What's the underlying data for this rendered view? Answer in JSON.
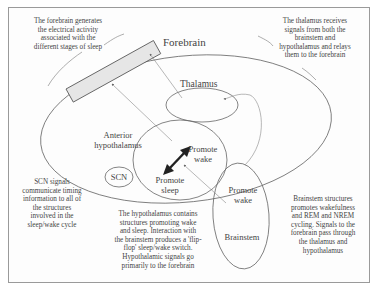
{
  "diagram": {
    "structures": {
      "forebrain": "Forebrain",
      "thalamus": "Thalamus",
      "anterior_hypothalamus": "Anterior hypothalamus",
      "anterior_hypothalamus_line1": "Anterior",
      "anterior_hypothalamus_line2": "hypothalamus",
      "hypothalamus_promote_wake_line1": "Promote",
      "hypothalamus_promote_wake_line2": "wake",
      "hypothalamus_promote_sleep_line1": "Promote",
      "hypothalamus_promote_sleep_line2": "sleep",
      "scn": "SCN",
      "brainstem_promote_wake_line1": "Promote",
      "brainstem_promote_wake_line2": "wake",
      "brainstem": "Brainstem"
    },
    "annotations": {
      "forebrain": [
        "The forebrain generates",
        "the electrical activity",
        "associated with the",
        "different stages of sleep"
      ],
      "thalamus": [
        "The thalamus receives",
        "signals from both the",
        "brainstem and",
        "hypothalamus and relays",
        "them to the forebrain"
      ],
      "scn": [
        "SCN signals",
        "communicate timing",
        "information to all of",
        "the structures",
        "involved in the",
        "sleep/wake cycle"
      ],
      "hypothalamus": [
        "The hypothalamus contains",
        "structures promoting wake",
        "and sleep. Interaction with",
        "the brainstem produces a 'flip-",
        "flop' sleep/wake switch.",
        "Hypothalamic signals go",
        "primarily to the forebrain"
      ],
      "brainstem": [
        "Brainstem structures",
        "promotes wakefulness",
        "and REM and NREM",
        "cycling. Signals to the",
        "forebrain pass through",
        "the thalamus and",
        "hypothalamus"
      ]
    },
    "colors": {
      "line": "#555555",
      "frame": "#9a9a9a",
      "forebrain_fill": "#e6e6e6",
      "arrow": "#222222"
    }
  }
}
